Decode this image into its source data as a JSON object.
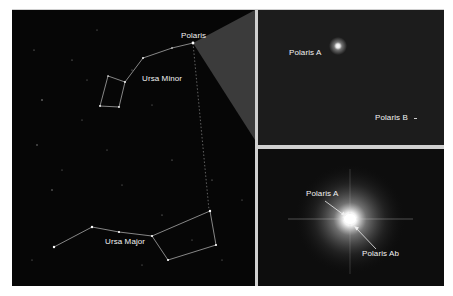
{
  "figure": {
    "left_panel": {
      "title": "Night sky star chart",
      "labels": {
        "polaris": "Polaris",
        "ursa_minor": "Ursa Minor",
        "ursa_major": "Ursa Major"
      },
      "colors": {
        "background": "#060606",
        "lines": "#bfbfbf",
        "zoom_wedge": "#3a3a3a"
      }
    },
    "top_right_panel": {
      "labels": {
        "polaris_a": "Polaris A",
        "polaris_b": "Polaris B"
      }
    },
    "bottom_right_panel": {
      "labels": {
        "polaris_a": "Polaris A",
        "polaris_ab": "Polaris Ab"
      }
    }
  }
}
